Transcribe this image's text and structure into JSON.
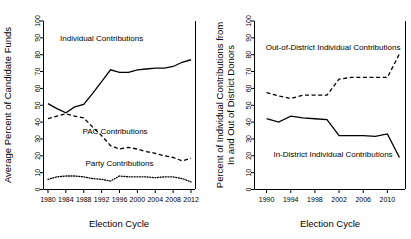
{
  "figure": {
    "panels": [
      "left",
      "right"
    ]
  },
  "chart_data": [
    {
      "type": "line",
      "panel": "left",
      "title": "",
      "xlabel": "Election Cycle",
      "ylabel": "Average Percent of Candidate Funds",
      "ylabel_lines": [
        "Average Percent of Candidate Funds"
      ],
      "xlim": [
        1979,
        2013
      ],
      "ylim": [
        0,
        100
      ],
      "xticks": [
        1980,
        1984,
        1988,
        1992,
        1996,
        2000,
        2004,
        2008,
        2012
      ],
      "xticklabels": [
        "1980",
        "1984",
        "1988",
        "1992",
        "1996",
        "2000",
        "2004",
        "2008",
        "2012"
      ],
      "yticks": [
        0,
        10,
        20,
        30,
        40,
        50,
        60,
        70,
        80,
        90,
        100
      ],
      "yticklabels": [
        "0",
        "10",
        "20",
        "30",
        "40",
        "50",
        "60",
        "70",
        "80",
        "90",
        "100"
      ],
      "grid": false,
      "legend_position": "inline-annotations",
      "x": [
        1980,
        1982,
        1984,
        1986,
        1988,
        1990,
        1992,
        1994,
        1996,
        1998,
        2000,
        2002,
        2004,
        2006,
        2008,
        2010,
        2012
      ],
      "series": [
        {
          "name": "Individual Contributions",
          "style": "solid",
          "label": "Individual Contributions",
          "label_x": 1992,
          "label_y": 88,
          "values": [
            51,
            48,
            45.5,
            49,
            50.5,
            57,
            64,
            71,
            69.5,
            69.5,
            71,
            71.5,
            72,
            72,
            73,
            75.5,
            77
          ]
        },
        {
          "name": "PAC Contributions",
          "style": "dashed",
          "label": "PAC Contributions",
          "label_x": 1995,
          "label_y": 33,
          "values": [
            42,
            43.5,
            45,
            43.5,
            42.5,
            37,
            32,
            26,
            24,
            25,
            24,
            22.5,
            21.5,
            20,
            19,
            17,
            18.5
          ]
        },
        {
          "name": "Party Contributions",
          "style": "dotted",
          "label": "Party Contributions",
          "label_x": 1996,
          "label_y": 14,
          "values": [
            6,
            7.5,
            8,
            8,
            7.5,
            6.5,
            6,
            5,
            8,
            7.5,
            7.5,
            7.5,
            7,
            7.5,
            7.5,
            6.5,
            4.5
          ]
        }
      ]
    },
    {
      "type": "line",
      "panel": "right",
      "title": "",
      "xlabel": "Election Cycle",
      "ylabel": "Percent of Individual Contributions from In and Out of District Donors",
      "ylabel_lines": [
        "Percent of Individual Contributions from",
        "In and Out of District Donors"
      ],
      "xlim": [
        1988,
        2013
      ],
      "ylim": [
        0,
        100
      ],
      "xticks": [
        1990,
        1994,
        1998,
        2002,
        2006,
        2010
      ],
      "xticklabels": [
        "1990",
        "1994",
        "1998",
        "2002",
        "2006",
        "2010"
      ],
      "yticks": [
        0,
        10,
        20,
        30,
        40,
        50,
        60,
        70,
        80,
        90,
        100
      ],
      "yticklabels": [
        "0",
        "10",
        "20",
        "30",
        "40",
        "50",
        "60",
        "70",
        "80",
        "90",
        "100"
      ],
      "grid": false,
      "legend_position": "inline-annotations",
      "x": [
        1990,
        1992,
        1994,
        1996,
        1998,
        2000,
        2002,
        2004,
        2006,
        2008,
        2010,
        2012
      ],
      "series": [
        {
          "name": "Out-of-District Individual Contributions",
          "style": "dashed",
          "label": "Out-of-District Individual Contributions",
          "label_x": 2001,
          "label_y": 83,
          "values": [
            57.5,
            55.5,
            54,
            56,
            56,
            56,
            65.5,
            66.5,
            66.5,
            66.5,
            66.5,
            80.5
          ]
        },
        {
          "name": "In-District Individual Contributions",
          "style": "solid",
          "label": "In-District Individual Contributions",
          "label_x": 2001,
          "label_y": 19,
          "values": [
            42,
            40,
            43.5,
            42.5,
            42,
            41.5,
            32,
            32,
            32,
            31.5,
            33,
            19
          ]
        }
      ]
    }
  ]
}
